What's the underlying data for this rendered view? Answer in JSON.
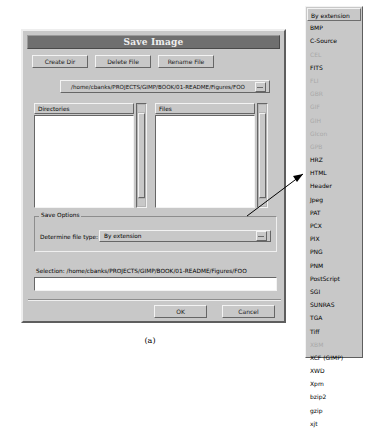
{
  "dialog": {
    "title": "Save Image",
    "buttons": [
      {
        "label": "Create Dir"
      },
      {
        "label": "Delete File"
      },
      {
        "label": "Rename File"
      }
    ],
    "path": "/home/cbanks/PROJECTS/GIMP/BOOK/01-README/Figures/FOO",
    "panes": {
      "directories_label": "Directories",
      "files_label": "Files",
      "directories_items": [],
      "files_items": []
    },
    "save_options": {
      "frame_label": "Save Options",
      "file_type_label": "Determine file type:",
      "file_type_value": "By extension"
    },
    "selection_label": "Selection: /home/cbanks/PROJECTS/GIMP/BOOK/01-README/Figures/FOO",
    "selection_value": "",
    "ok_label": "OK",
    "cancel_label": "Cancel"
  },
  "filetype_menu": {
    "items": [
      {
        "label": "By extension",
        "selected": true,
        "disabled": false
      },
      {
        "label": "BMP",
        "selected": false,
        "disabled": false
      },
      {
        "label": "C-Source",
        "selected": false,
        "disabled": false
      },
      {
        "label": "CEL",
        "selected": false,
        "disabled": true
      },
      {
        "label": "FITS",
        "selected": false,
        "disabled": false
      },
      {
        "label": "FLI",
        "selected": false,
        "disabled": true
      },
      {
        "label": "GBR",
        "selected": false,
        "disabled": true
      },
      {
        "label": "GIF",
        "selected": false,
        "disabled": true
      },
      {
        "label": "GIH",
        "selected": false,
        "disabled": true
      },
      {
        "label": "GIcon",
        "selected": false,
        "disabled": true
      },
      {
        "label": "GPB",
        "selected": false,
        "disabled": true
      },
      {
        "label": "HRZ",
        "selected": false,
        "disabled": false
      },
      {
        "label": "HTML",
        "selected": false,
        "disabled": false
      },
      {
        "label": "Header",
        "selected": false,
        "disabled": false
      },
      {
        "label": "Jpeg",
        "selected": false,
        "disabled": false
      },
      {
        "label": "PAT",
        "selected": false,
        "disabled": false
      },
      {
        "label": "PCX",
        "selected": false,
        "disabled": false
      },
      {
        "label": "PIX",
        "selected": false,
        "disabled": false
      },
      {
        "label": "PNG",
        "selected": false,
        "disabled": false
      },
      {
        "label": "PNM",
        "selected": false,
        "disabled": false
      },
      {
        "label": "PostScript",
        "selected": false,
        "disabled": false
      },
      {
        "label": "SGI",
        "selected": false,
        "disabled": false
      },
      {
        "label": "SUNRAS",
        "selected": false,
        "disabled": false
      },
      {
        "label": "TGA",
        "selected": false,
        "disabled": false
      },
      {
        "label": "Tiff",
        "selected": false,
        "disabled": false
      },
      {
        "label": "XBM",
        "selected": false,
        "disabled": true
      },
      {
        "label": "XCF (GIMP)",
        "selected": false,
        "disabled": false
      },
      {
        "label": "XWD",
        "selected": false,
        "disabled": false
      },
      {
        "label": "Xpm",
        "selected": false,
        "disabled": false
      },
      {
        "label": "bzip2",
        "selected": false,
        "disabled": false
      },
      {
        "label": "gzip",
        "selected": false,
        "disabled": false
      },
      {
        "label": "xjt",
        "selected": false,
        "disabled": false
      }
    ]
  },
  "figure": {
    "caption": "(a)"
  },
  "colors": {
    "face": "#c8c8c8",
    "titlebar": "#6f6f6f",
    "entry": "#ffffff",
    "disabled_text": "#a8a8a8"
  }
}
